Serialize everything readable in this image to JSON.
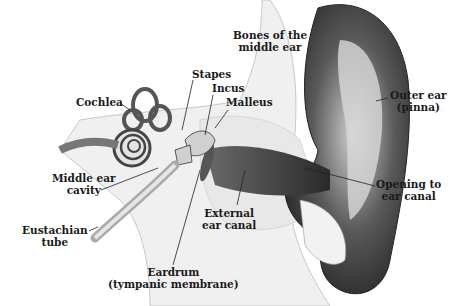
{
  "diagram": {
    "labels": {
      "bones": [
        "Bones of the",
        "middle ear"
      ],
      "stapes": "Stapes",
      "incus": "Incus",
      "malleus": "Malleus",
      "cochlea": "Cochlea",
      "outer_ear": [
        "Outer ear",
        "(pinna)"
      ],
      "middle_ear_cavity": [
        "Middle ear",
        "cavity"
      ],
      "opening": [
        "Opening to",
        "ear canal"
      ],
      "external_canal": [
        "External",
        "ear canal"
      ],
      "eustachian": [
        "Eustachian",
        "tube"
      ],
      "eardrum": [
        "Eardrum",
        "(tympanic membrane)"
      ]
    },
    "colors": {
      "ink": "#1a1a1a",
      "skin_dark": "#3a3a3a",
      "skin_mid": "#8a8a8a",
      "bone": "#e6e6e6",
      "background": "#ffffff"
    }
  }
}
